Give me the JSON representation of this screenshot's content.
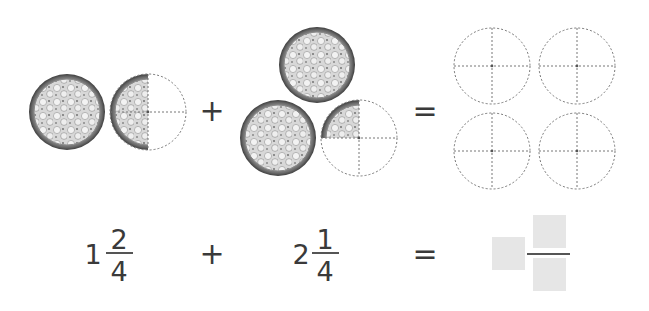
{
  "problem": {
    "type": "mixed-number addition with pizza models",
    "top_row": {
      "group1": {
        "whole_pizzas": 1,
        "partial_fraction": "2/4",
        "label": "1 2/4"
      },
      "plus": "+",
      "group2": {
        "whole_pizzas": 2,
        "partial_fraction": "1/4",
        "label": "2 1/4"
      },
      "equals": "=",
      "empty_circles": 4,
      "circle_divisions": 4
    },
    "bottom_row": {
      "term1": {
        "whole": "1",
        "numerator": "2",
        "denominator": "4"
      },
      "plus": "+",
      "term2": {
        "whole": "2",
        "numerator": "1",
        "denominator": "4"
      },
      "equals": "=",
      "answer": {
        "whole": "",
        "numerator": "",
        "denominator": ""
      }
    }
  },
  "colors": {
    "answer_box": "#e6e6e6",
    "text": "#3a3a3a",
    "dashed_outline": "#777777"
  }
}
